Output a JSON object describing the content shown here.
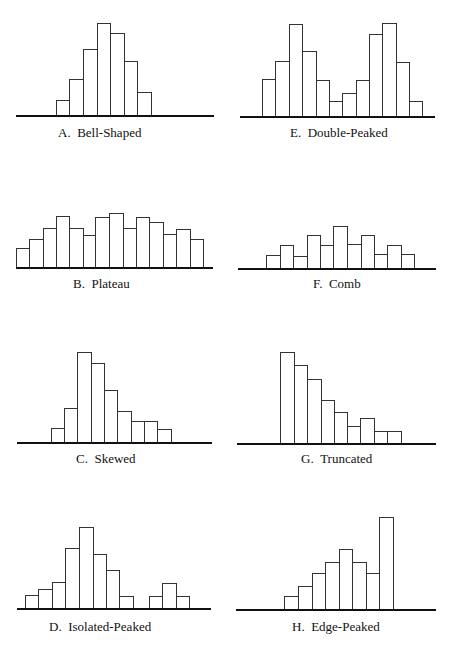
{
  "colors": {
    "bar_fill": "#ffffff",
    "bar_stroke": "#333333",
    "axis": "#111111",
    "text": "#111111"
  },
  "chart_data": [
    {
      "type": "bar",
      "id": "A",
      "title": "A.  Bell-Shaped",
      "panel": {
        "axis_x1": 16,
        "axis_x2": 214,
        "baseline": 115,
        "label_x": 58,
        "label_y": 137
      },
      "edges": [
        56,
        69,
        83,
        97,
        110,
        124,
        137,
        151
      ],
      "values": [
        15,
        36,
        66,
        92,
        82,
        54,
        23
      ]
    },
    {
      "type": "bar",
      "id": "E",
      "title": "E.  Double-Peaked",
      "panel": {
        "axis_x1": 240,
        "axis_x2": 435,
        "baseline": 116,
        "label_x": 290,
        "label_y": 137
      },
      "edges": [
        262,
        275,
        289,
        302,
        316,
        329,
        342,
        356,
        369,
        382,
        396,
        409,
        422
      ],
      "values": [
        37,
        55,
        92,
        65,
        36,
        15,
        23,
        36,
        82,
        93,
        54,
        15
      ]
    },
    {
      "type": "bar",
      "id": "B",
      "title": "B.  Plateau",
      "panel": {
        "axis_x1": 16,
        "axis_x2": 213,
        "baseline": 267,
        "label_x": 73,
        "label_y": 288
      },
      "edges": [
        16,
        29,
        43,
        56,
        69,
        83,
        95,
        109,
        123,
        136,
        149,
        163,
        176,
        190,
        203
      ],
      "values": [
        19,
        28,
        39,
        51,
        39,
        32,
        50,
        54,
        39,
        50,
        45,
        33,
        38,
        28
      ]
    },
    {
      "type": "bar",
      "id": "F",
      "title": "F.  Comb",
      "panel": {
        "axis_x1": 238,
        "axis_x2": 436,
        "baseline": 268,
        "label_x": 313,
        "label_y": 288
      },
      "edges": [
        266,
        280,
        293,
        307,
        320,
        333,
        347,
        361,
        374,
        387,
        401,
        414
      ],
      "values": [
        13,
        23,
        12,
        33,
        23,
        42,
        24,
        33,
        14,
        23,
        14
      ]
    },
    {
      "type": "bar",
      "id": "C",
      "title": "C.  Skewed",
      "panel": {
        "axis_x1": 17,
        "axis_x2": 212,
        "baseline": 442,
        "label_x": 76,
        "label_y": 463
      },
      "edges": [
        51,
        64,
        77,
        91,
        104,
        117,
        131,
        144,
        157,
        171
      ],
      "values": [
        14,
        34,
        90,
        79,
        52,
        31,
        21,
        21,
        13
      ]
    },
    {
      "type": "bar",
      "id": "G",
      "title": "G.  Truncated",
      "panel": {
        "axis_x1": 237,
        "axis_x2": 436,
        "baseline": 443,
        "label_x": 301,
        "label_y": 463
      },
      "edges": [
        280,
        294,
        307,
        321,
        334,
        347,
        360,
        374,
        387,
        401
      ],
      "values": [
        91,
        78,
        64,
        43,
        31,
        17,
        25,
        12,
        12
      ]
    },
    {
      "type": "bar",
      "id": "D",
      "title": "D.  Isolated-Peaked",
      "panel": {
        "axis_x1": 17,
        "axis_x2": 211,
        "baseline": 608,
        "label_x": 49,
        "label_y": 631
      },
      "edges": [
        25,
        38,
        52,
        65,
        79,
        93,
        106,
        119,
        133
      ],
      "values": [
        13,
        19,
        26,
        60,
        81,
        54,
        38,
        12
      ],
      "isolated": {
        "edges": [
          149,
          162,
          176,
          189
        ],
        "values": [
          12,
          25,
          12
        ]
      }
    },
    {
      "type": "bar",
      "id": "H",
      "title": "H.  Edge-Peaked",
      "panel": {
        "axis_x1": 236,
        "axis_x2": 436,
        "baseline": 609,
        "label_x": 292,
        "label_y": 631
      },
      "edges": [
        284,
        298,
        312,
        325,
        339,
        352,
        366,
        379,
        393
      ],
      "values": [
        13,
        23,
        36,
        47,
        60,
        47,
        36,
        92
      ]
    }
  ]
}
